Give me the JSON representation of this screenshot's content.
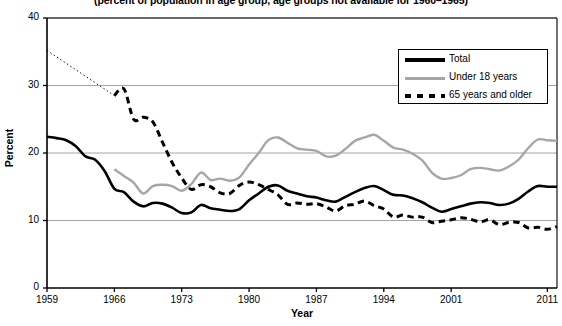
{
  "chart_data": {
    "type": "line",
    "title": "(percent of population in age group, age groups not available for 1960–1965)",
    "xlabel": "Year",
    "ylabel": "Percent",
    "xlim": [
      1959,
      2012
    ],
    "ylim": [
      0,
      40
    ],
    "yticks": [
      0,
      10,
      20,
      30,
      40
    ],
    "xticks": [
      1959,
      1966,
      1973,
      1980,
      1987,
      1994,
      2001,
      2011
    ],
    "xtick_labels": [
      "1959",
      "1966",
      "1973",
      "1980",
      "1987",
      "1994",
      "2001",
      "2011"
    ],
    "ytick_labels": [
      "0",
      "10",
      "20",
      "30",
      "40"
    ],
    "grid": "horizontal",
    "legend_position": "top-right",
    "colors": {
      "total": "#000000",
      "under18": "#a6a6a6",
      "over65": "#000000",
      "gridline": "#9a9a9a",
      "axis": "#000000"
    },
    "x": [
      1959,
      1960,
      1961,
      1962,
      1963,
      1964,
      1965,
      1966,
      1967,
      1968,
      1969,
      1970,
      1971,
      1972,
      1973,
      1974,
      1975,
      1976,
      1977,
      1978,
      1979,
      1980,
      1981,
      1982,
      1983,
      1984,
      1985,
      1986,
      1987,
      1988,
      1989,
      1990,
      1991,
      1992,
      1993,
      1994,
      1995,
      1996,
      1997,
      1998,
      1999,
      2000,
      2001,
      2002,
      2003,
      2004,
      2005,
      2006,
      2007,
      2008,
      2009,
      2010,
      2011,
      2012
    ],
    "series": [
      {
        "name": "Total",
        "style": "solid-thick",
        "color": "#000000",
        "values": [
          22.4,
          22.2,
          21.9,
          21.0,
          19.5,
          19.0,
          17.3,
          14.7,
          14.2,
          12.8,
          12.1,
          12.6,
          12.5,
          11.9,
          11.1,
          11.2,
          12.3,
          11.8,
          11.6,
          11.4,
          11.7,
          13.0,
          14.0,
          15.0,
          15.2,
          14.4,
          14.0,
          13.6,
          13.4,
          13.0,
          12.8,
          13.5,
          14.2,
          14.8,
          15.1,
          14.5,
          13.8,
          13.7,
          13.3,
          12.7,
          11.9,
          11.3,
          11.7,
          12.1,
          12.5,
          12.7,
          12.6,
          12.3,
          12.5,
          13.2,
          14.3,
          15.1,
          15.0,
          15.0
        ]
      },
      {
        "name": "Under 18 years",
        "style": "solid-gray",
        "color": "#a6a6a6",
        "values": [
          null,
          null,
          null,
          null,
          null,
          null,
          null,
          17.6,
          16.6,
          15.6,
          14.0,
          15.1,
          15.3,
          15.1,
          14.4,
          15.4,
          17.1,
          16.0,
          16.2,
          15.9,
          16.4,
          18.3,
          20.0,
          21.9,
          22.3,
          21.5,
          20.7,
          20.5,
          20.3,
          19.5,
          19.6,
          20.6,
          21.8,
          22.3,
          22.7,
          21.8,
          20.8,
          20.5,
          19.9,
          18.9,
          17.1,
          16.2,
          16.3,
          16.7,
          17.6,
          17.8,
          17.6,
          17.4,
          18.0,
          19.0,
          20.7,
          22.0,
          21.9,
          21.8
        ]
      },
      {
        "name": "65 years and older",
        "style": "dashed",
        "color": "#000000",
        "values": [
          35.2,
          null,
          null,
          null,
          null,
          null,
          null,
          28.5,
          29.5,
          25.0,
          25.3,
          24.6,
          21.6,
          18.6,
          16.3,
          14.6,
          15.3,
          15.0,
          14.1,
          14.0,
          15.2,
          15.7,
          15.3,
          14.6,
          13.8,
          12.4,
          12.6,
          12.4,
          12.5,
          12.0,
          11.4,
          12.2,
          12.4,
          12.9,
          12.2,
          11.7,
          10.5,
          10.8,
          10.5,
          10.5,
          9.7,
          9.9,
          10.1,
          10.4,
          10.2,
          9.8,
          10.1,
          9.4,
          9.7,
          9.7,
          8.9,
          9.0,
          8.7,
          9.1
        ]
      }
    ],
    "interpolation_notes": {
      "dotted_segments": "1959 to 1966 values for Total and 65 years and older are shown as fine dotted interpolation lines because age group data is not available for 1960-1965"
    }
  },
  "legend": {
    "items": [
      {
        "label": "Total",
        "style": "solid-thick",
        "color": "#000000"
      },
      {
        "label": "Under 18 years",
        "style": "solid-gray",
        "color": "#a6a6a6"
      },
      {
        "label": "65 years and older",
        "style": "dashed",
        "color": "#000000"
      }
    ]
  }
}
